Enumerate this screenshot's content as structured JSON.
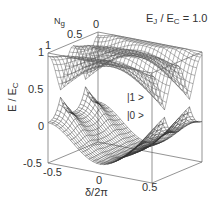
{
  "chart_data": {
    "type": "surface3d",
    "title_parts": {
      "e1": "E",
      "s1": "J",
      "mid": " / E",
      "s2": "C",
      "rest": " = 1.0"
    },
    "xlabel": "δ/2π",
    "ylabel": "E / E_C",
    "ylabel_text": "E / E",
    "ylabel_sub": "C",
    "zlabel": "N",
    "zlabel_sub": "g",
    "x_ticks": [
      "-0.5",
      "0",
      "0.5"
    ],
    "z_ticks": [
      "-0.5",
      "0",
      "0.5",
      "1"
    ],
    "ng_ticks": [
      "1",
      "0.5",
      "0"
    ],
    "xlim": [
      -0.5,
      0.5
    ],
    "ng_range": [
      0,
      1
    ],
    "ylim": [
      -0.5,
      1
    ],
    "series": [
      {
        "name": "|1 >",
        "description": "upper energy band surface"
      },
      {
        "name": "|0 >",
        "description": "lower energy band surface"
      }
    ],
    "ej_over_ec": 1.0,
    "grid": false
  },
  "labels": {
    "state1": "|1 >",
    "state0": "|0 >"
  }
}
